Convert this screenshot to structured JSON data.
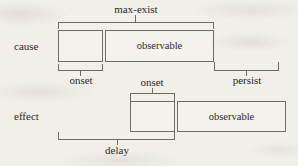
{
  "figure": {
    "background_color": "#f2efe9",
    "line_color": "#6e6b66",
    "text_color": "#2a2824"
  },
  "rows": [
    {
      "id": "cause",
      "label": "cause"
    },
    {
      "id": "effect",
      "label": "effect"
    }
  ],
  "bars": {
    "cause_onset": {
      "label": ""
    },
    "cause_observable": {
      "label": "observable"
    },
    "effect_onset": {
      "label": ""
    },
    "effect_observable": {
      "label": "observable"
    }
  },
  "brackets": {
    "max_exist": {
      "label": "max-exist",
      "direction": "down",
      "row": "cause",
      "position": "above"
    },
    "cause_onset": {
      "label": "onset",
      "direction": "up",
      "row": "cause",
      "position": "below"
    },
    "persist": {
      "label": "persist",
      "direction": "up",
      "row": "cause",
      "position": "below"
    },
    "effect_onset": {
      "label": "onset",
      "direction": "down",
      "row": "effect",
      "position": "above"
    },
    "delay": {
      "label": "delay",
      "direction": "up",
      "row": "effect",
      "position": "below"
    }
  }
}
